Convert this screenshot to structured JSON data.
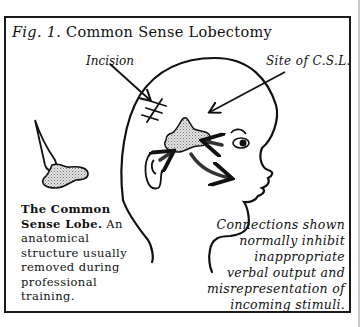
{
  "figure": {
    "number_label": "Fig. 1.",
    "title": "Common Sense Lobectomy"
  },
  "labels": {
    "incision": "Incision",
    "site": "Site of C.S.L."
  },
  "caption_left": {
    "bold": "The Common Sense Lobe.",
    "lines": [
      "An anatomical",
      "structure usually",
      "removed during",
      "professional training."
    ]
  },
  "caption_right": {
    "lines": [
      "Connections shown",
      "normally inhibit",
      "inappropriate",
      "verbal output and",
      "misrepresentation of",
      "incoming stimuli."
    ]
  },
  "colors": {
    "ink": "#111111",
    "stipple": "#b8b8b8",
    "frame": "#1a1a1a",
    "rule": "#c8c8c8"
  }
}
